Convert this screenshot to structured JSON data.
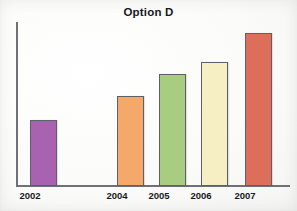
{
  "chart_data": {
    "type": "bar",
    "title": "Option D",
    "xlabel": "",
    "ylabel": "",
    "categories": [
      "2002",
      "2004",
      "2005",
      "2006",
      "2007"
    ],
    "values": [
      43,
      59,
      73,
      81,
      100
    ],
    "ylim": [
      0,
      107
    ],
    "grid": false,
    "legend": null,
    "axis_tick_labels_y": [],
    "bar_colors": [
      "#a862b0",
      "#f4a96b",
      "#a8cc80",
      "#f7efc4",
      "#dc6e5a"
    ],
    "bar_border_color": "#5e6066",
    "axis_color": "#6f7176",
    "background_color": "#ffffff",
    "title_color": "#16181c"
  }
}
